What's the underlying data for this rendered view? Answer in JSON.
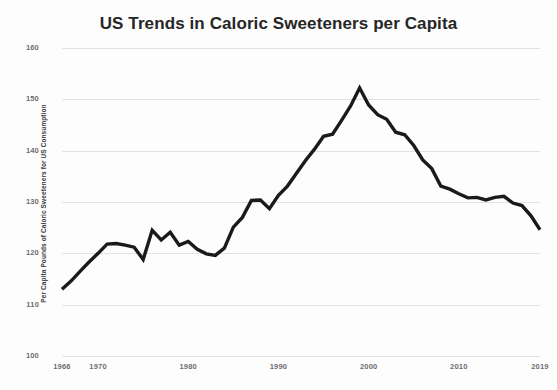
{
  "chart_data": {
    "type": "line",
    "title": "US Trends in Caloric Sweeteners per Capita",
    "xlabel": "",
    "ylabel": "Per Capita Pounds of Caloric Sweeteners for US Consumption",
    "xlim": [
      1966,
      2019
    ],
    "ylim": [
      100,
      160
    ],
    "yticks": [
      100,
      110,
      120,
      130,
      140,
      150,
      160
    ],
    "xticks": [
      1966,
      1970,
      1980,
      1990,
      2000,
      2010,
      2019
    ],
    "grid": true,
    "legend": "none",
    "line_color": "#1a1a1a",
    "line_width": 3.4,
    "series": [
      {
        "name": "Caloric sweeteners per capita",
        "x": [
          1966,
          1967,
          1968,
          1969,
          1970,
          1971,
          1972,
          1973,
          1974,
          1975,
          1976,
          1977,
          1978,
          1979,
          1980,
          1981,
          1982,
          1983,
          1984,
          1985,
          1986,
          1987,
          1988,
          1989,
          1990,
          1991,
          1992,
          1993,
          1994,
          1995,
          1996,
          1997,
          1998,
          1999,
          2000,
          2001,
          2002,
          2003,
          2004,
          2005,
          2006,
          2007,
          2008,
          2009,
          2010,
          2011,
          2012,
          2013,
          2014,
          2015,
          2016,
          2017,
          2018,
          2019
        ],
        "values": [
          113.0,
          114.6,
          116.5,
          118.3,
          120.0,
          121.8,
          121.9,
          121.6,
          121.2,
          118.8,
          124.5,
          122.6,
          124.1,
          121.6,
          122.3,
          120.8,
          119.9,
          119.6,
          121.0,
          125.1,
          127.0,
          130.3,
          130.4,
          128.7,
          131.3,
          133.1,
          135.6,
          138.1,
          140.3,
          142.8,
          143.2,
          145.9,
          148.7,
          152.2,
          148.9,
          147.0,
          146.1,
          143.6,
          143.1,
          141.0,
          138.2,
          136.5,
          133.1,
          132.5,
          131.6,
          130.8,
          130.9,
          130.4,
          130.9,
          131.1,
          129.8,
          129.3,
          127.3,
          124.6
        ]
      }
    ]
  },
  "axes": {
    "y_tick_labels": [
      "160",
      "150",
      "140",
      "130",
      "120",
      "110",
      "100"
    ],
    "x_tick_labels": [
      "1966",
      "1970",
      "1980",
      "1990",
      "2000",
      "2010",
      "2019"
    ]
  }
}
